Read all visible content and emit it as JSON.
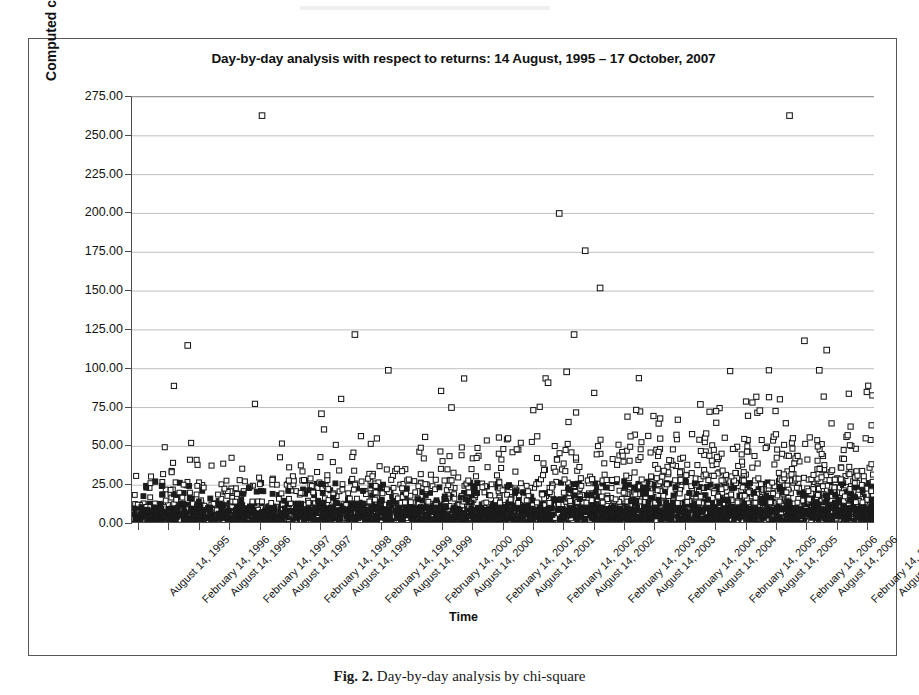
{
  "figure": {
    "caption_label": "Fig. 2.",
    "caption_text": "Day-by-day analysis by chi-square"
  },
  "chart_data": {
    "type": "scatter",
    "title": "Day-by-day analysis with respect to returns: 14 August, 1995 – 17 October, 2007",
    "xlabel": "Time",
    "ylabel": "Computed chi-square",
    "ylim": [
      0,
      275
    ],
    "ytick_step": 25,
    "ytick_labels": [
      "0.00",
      "25.00",
      "50.00",
      "75.00",
      "100.00",
      "125.00",
      "150.00",
      "175.00",
      "200.00",
      "225.00",
      "250.00",
      "275.00"
    ],
    "grid": "horizontal",
    "legend": "none",
    "marker": "open-square",
    "marker_color": "#1a1a1a",
    "marker_fill": "#ffffff",
    "xtick_labels": [
      "August 14, 1995",
      "February 14, 1996",
      "August 14, 1996",
      "February 14, 1997",
      "August 14, 1997",
      "February 14, 1998",
      "August 14, 1998",
      "February 14, 1999",
      "August 14, 1999",
      "February 14, 2000",
      "August 14, 2000",
      "February 14, 2001",
      "August 14, 2001",
      "February 14, 2002",
      "August 14, 2002",
      "February 14, 2003",
      "August 14, 2003",
      "February 14, 2004",
      "August 14, 2004",
      "February 14, 2005",
      "August 14, 2005",
      "February 14, 2006",
      "August 14, 2006",
      "February 14, 2007",
      "August 14, 2007"
    ],
    "xrange_start": "August 14, 1995",
    "xrange_end": "October 17, 2007",
    "notable_points": [
      {
        "x": 0.175,
        "y": 263.0,
        "note": "global maximum, early 2007"
      },
      {
        "x": 0.885,
        "y": 263.0,
        "note": "global maximum near February 2007"
      },
      {
        "x": 0.575,
        "y": 200.0,
        "note": "late 2002 spike"
      },
      {
        "x": 0.61,
        "y": 176.0,
        "note": "early 2003 spike"
      },
      {
        "x": 0.63,
        "y": 152.0,
        "note": "2003 spike"
      },
      {
        "x": 0.075,
        "y": 115.0,
        "note": "late 1995 spike"
      },
      {
        "x": 0.3,
        "y": 122.0,
        "note": "1997-98 spike"
      },
      {
        "x": 0.345,
        "y": 99.0,
        "note": "1998 spike"
      },
      {
        "x": 0.595,
        "y": 122.0,
        "note": "2003 spike"
      },
      {
        "x": 0.905,
        "y": 118.0,
        "note": "2007 spike"
      },
      {
        "x": 0.935,
        "y": 112.0,
        "note": "2007 spike"
      },
      {
        "x": 0.925,
        "y": 99.0,
        "note": "2007 spike"
      },
      {
        "x": 0.56,
        "y": 91.0,
        "note": "2002 cluster"
      },
      {
        "x": 0.585,
        "y": 98.0,
        "note": "2003 cluster"
      },
      {
        "x": 0.255,
        "y": 71.0,
        "note": "1997 point"
      },
      {
        "x": 0.43,
        "y": 75.0,
        "note": "2000 point"
      },
      {
        "x": 0.765,
        "y": 77.0,
        "note": "2005 point"
      },
      {
        "x": 0.845,
        "y": 73.0,
        "note": "2006 point"
      }
    ],
    "baseline_band": {
      "low": 0.0,
      "high": 13.5,
      "description": "extremely dense near-solid band of daily chi-square values"
    },
    "bulk_band": {
      "low": 13.5,
      "high": 28.0,
      "description": "dense scatter of daily values just above the solid band"
    },
    "series_name": "Computed chi-square per day",
    "n_points_approx": 3000
  }
}
